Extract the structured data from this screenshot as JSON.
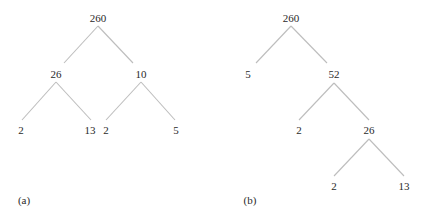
{
  "diagram": {
    "type": "factor-trees",
    "trees": [
      {
        "caption": "(a)",
        "nodes": {
          "root": "260",
          "l": "26",
          "r": "10",
          "ll": "2",
          "lr": "13",
          "rl": "2",
          "rr": "5"
        }
      },
      {
        "caption": "(b)",
        "nodes": {
          "root": "260",
          "l": "5",
          "r": "52",
          "rl": "2",
          "rr": "26",
          "rrl": "2",
          "rrr": "13"
        }
      }
    ],
    "edge_color": "#bdbdbd"
  }
}
